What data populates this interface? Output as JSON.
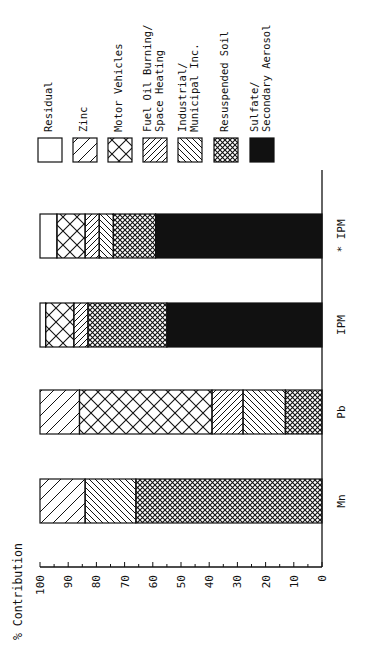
{
  "chart_data": {
    "type": "bar",
    "stacked": true,
    "orientation": "vertical (image rotated 90° counter-clockwise)",
    "title": "",
    "ylabel": "% Contribution",
    "xlabel": "",
    "ylim": [
      0,
      100
    ],
    "yticks": [
      0,
      10,
      20,
      30,
      40,
      50,
      60,
      70,
      80,
      90,
      100
    ],
    "categories": [
      "Mn",
      "Pb",
      "IPM",
      "* IPM"
    ],
    "series": [
      {
        "name": "Residual",
        "pattern": "empty",
        "values": [
          0,
          0,
          2,
          6
        ]
      },
      {
        "name": "Zinc",
        "pattern": "wide-forward-diagonal",
        "values": [
          16,
          14,
          0,
          0
        ]
      },
      {
        "name": "Motor Vehicles",
        "pattern": "wide-crosshatch",
        "values": [
          0,
          47,
          10,
          10
        ]
      },
      {
        "name": "Fuel Oil Burning/ Space Heating",
        "pattern": "narrow-forward-diagonal",
        "values": [
          0,
          11,
          5,
          5
        ]
      },
      {
        "name": "Industrial/ Municipal Inc.",
        "pattern": "narrow-back-diagonal",
        "values": [
          18,
          15,
          0,
          5
        ]
      },
      {
        "name": "Resuspended Soil",
        "pattern": "fine-crosshatch",
        "values": [
          66,
          13,
          28,
          15
        ]
      },
      {
        "name": "Sulfate/ Secondary Aerosol",
        "pattern": "solid-black",
        "values": [
          0,
          0,
          55,
          59
        ]
      }
    ],
    "legend_position": "top (right of plot in unrotated orientation)",
    "grid": false
  },
  "axis": {
    "title": "% Contribution",
    "ticks": [
      "100",
      "90",
      "80",
      "70",
      "60",
      "50",
      "40",
      "30",
      "20",
      "10",
      "0"
    ]
  },
  "categories": [
    "Mn",
    "Pb",
    "IPM",
    "* IPM"
  ],
  "legend": [
    {
      "lines": [
        "Residual"
      ],
      "pattern": "empty"
    },
    {
      "lines": [
        "Zinc"
      ],
      "pattern": "wide-forward-diagonal"
    },
    {
      "lines": [
        "Motor Vehicles"
      ],
      "pattern": "wide-crosshatch"
    },
    {
      "lines": [
        "Fuel Oil Burning/",
        "Space Heating"
      ],
      "pattern": "narrow-forward-diagonal"
    },
    {
      "lines": [
        "Industrial/",
        "Municipal Inc."
      ],
      "pattern": "narrow-back-diagonal"
    },
    {
      "lines": [
        "Resuspended Soil"
      ],
      "pattern": "fine-crosshatch"
    },
    {
      "lines": [
        "Sulfate/",
        "Secondary Aerosol"
      ],
      "pattern": "solid-black"
    }
  ],
  "colors": {
    "ink": "#111111",
    "background": "#ffffff"
  }
}
